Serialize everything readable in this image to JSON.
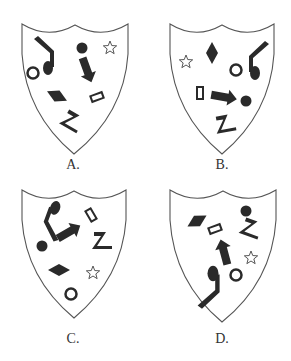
{
  "options": [
    {
      "label": "A.",
      "label_pos": [
        73,
        157
      ],
      "shield": {
        "left": 22,
        "right": 128,
        "top": 24,
        "tip": [
          74,
          154
        ]
      },
      "shapes": [
        {
          "type": "note",
          "x": 48,
          "y": 53,
          "s": 1,
          "rot": 0,
          "flip": false
        },
        {
          "type": "circle-open",
          "x": 33,
          "y": 73
        },
        {
          "type": "dot",
          "x": 82,
          "y": 48
        },
        {
          "type": "arrow",
          "x": 87,
          "y": 70,
          "rot": 70
        },
        {
          "type": "star",
          "x": 110,
          "y": 48
        },
        {
          "type": "diamond",
          "x": 57,
          "y": 96,
          "rot": 25
        },
        {
          "type": "rect-open",
          "x": 97,
          "y": 97,
          "rot": -20
        },
        {
          "type": "zigzag",
          "x": 73,
          "y": 121,
          "rot": 30
        }
      ]
    },
    {
      "label": "B.",
      "label_pos": [
        222,
        157
      ],
      "shield": {
        "left": 170,
        "right": 274,
        "top": 24,
        "tip": [
          222,
          154
        ]
      },
      "shapes": [
        {
          "type": "star",
          "x": 186,
          "y": 62
        },
        {
          "type": "diamond",
          "x": 212,
          "y": 53,
          "rot": 90
        },
        {
          "type": "circle-open",
          "x": 236,
          "y": 70
        },
        {
          "type": "note",
          "x": 255,
          "y": 58,
          "s": 1,
          "rot": 0,
          "flip": true
        },
        {
          "type": "rect-open",
          "x": 200,
          "y": 93,
          "rot": 90
        },
        {
          "type": "arrow",
          "x": 224,
          "y": 97,
          "rot": 10
        },
        {
          "type": "dot",
          "x": 246,
          "y": 101
        },
        {
          "type": "zigzag",
          "x": 226,
          "y": 123,
          "rot": -10
        }
      ]
    },
    {
      "label": "C.",
      "label_pos": [
        73,
        331
      ],
      "shield": {
        "left": 22,
        "right": 126,
        "top": 190,
        "tip": [
          74,
          318
        ]
      },
      "shapes": [
        {
          "type": "note",
          "x": 50,
          "y": 222,
          "s": 1,
          "rot": 200,
          "flip": false
        },
        {
          "type": "dot",
          "x": 42,
          "y": 246
        },
        {
          "type": "arrow",
          "x": 69,
          "y": 232,
          "rot": -30
        },
        {
          "type": "rect-open",
          "x": 91,
          "y": 215,
          "rot": 60
        },
        {
          "type": "zigzag",
          "x": 103,
          "y": 240,
          "rot": 0
        },
        {
          "type": "diamond",
          "x": 59,
          "y": 270,
          "rot": 0
        },
        {
          "type": "star",
          "x": 93,
          "y": 273
        },
        {
          "type": "circle-open",
          "x": 71,
          "y": 294
        }
      ]
    },
    {
      "label": "D.",
      "label_pos": [
        222,
        331
      ],
      "shield": {
        "left": 170,
        "right": 276,
        "top": 190,
        "tip": [
          222,
          322
        ]
      },
      "shapes": [
        {
          "type": "diamond",
          "x": 197,
          "y": 221,
          "rot": -30
        },
        {
          "type": "rect-open",
          "x": 215,
          "y": 229,
          "rot": -20
        },
        {
          "type": "dot",
          "x": 246,
          "y": 211
        },
        {
          "type": "zigzag",
          "x": 252,
          "y": 228,
          "rot": 20
        },
        {
          "type": "arrow",
          "x": 224,
          "y": 252,
          "rot": -105
        },
        {
          "type": "star",
          "x": 251,
          "y": 258
        },
        {
          "type": "circle-open",
          "x": 236,
          "y": 275
        },
        {
          "type": "note",
          "x": 213,
          "y": 290,
          "s": 1.1,
          "rot": 180,
          "flip": true
        }
      ]
    }
  ],
  "colors": {
    "ink": "#2a2a2a",
    "outline": "#555555",
    "paper": "#ffffff"
  }
}
